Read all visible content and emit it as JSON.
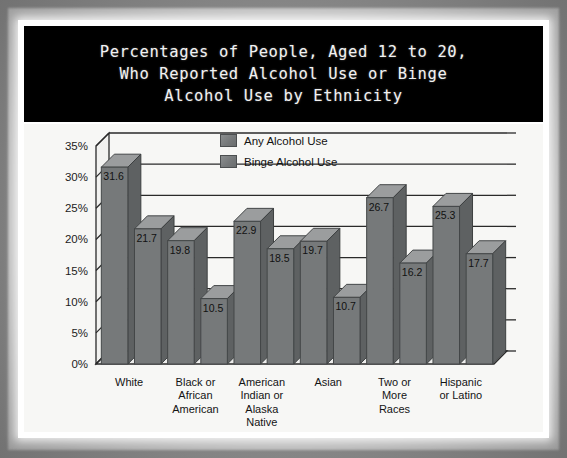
{
  "title": "Percentages of People, Aged 12 to 20,\nWho Reported Alcohol Use or Binge\nAlcohol Use by Ethnicity",
  "legend": {
    "items": [
      {
        "label": "Any Alcohol Use",
        "color": "#76797a"
      },
      {
        "label": "Binge Alcohol Use",
        "color": "#76797a"
      }
    ]
  },
  "colors": {
    "bar_face": "#76797a",
    "bar_top": "#9b9d9e",
    "bar_side": "#5e6162",
    "plot_background": "#f7f7f5",
    "gridline": "#2a2a2a",
    "banner_background": "#000000",
    "banner_text": "#f2f2f2",
    "frame": "#ffffff"
  },
  "chart_data": {
    "type": "bar",
    "title": "Percentages of People, Aged 12 to 20, Who Reported Alcohol Use or Binge Alcohol Use by Ethnicity",
    "xlabel": "",
    "ylabel": "",
    "ylim": [
      0,
      35
    ],
    "ytick_values": [
      0,
      5,
      10,
      15,
      20,
      25,
      30,
      35
    ],
    "ytick_labels": [
      "0%",
      "5%",
      "10%",
      "15%",
      "20%",
      "25%",
      "30%",
      "35%"
    ],
    "grid": true,
    "legend_position": "top-center",
    "categories": [
      "White",
      "Black or African American",
      "American Indian or Alaska Native",
      "Asian",
      "Two or More Races",
      "Hispanic or Latino"
    ],
    "category_lines": [
      [
        "White"
      ],
      [
        "Black or",
        "African",
        "American"
      ],
      [
        "American",
        "Indian or",
        "Alaska",
        "Native"
      ],
      [
        "Asian"
      ],
      [
        "Two or",
        "More",
        "Races"
      ],
      [
        "Hispanic",
        "or Latino"
      ]
    ],
    "series": [
      {
        "name": "Any Alcohol Use",
        "values": [
          31.6,
          19.8,
          22.9,
          19.7,
          26.7,
          25.3
        ]
      },
      {
        "name": "Binge Alcohol Use",
        "values": [
          21.7,
          10.5,
          18.5,
          10.7,
          16.2,
          17.7
        ]
      }
    ],
    "bar_order": [
      {
        "category": "White",
        "series": "Any Alcohol Use",
        "value": 31.6
      },
      {
        "category": "White",
        "series": "Binge Alcohol Use",
        "value": 21.7
      },
      {
        "category": "Black or African American",
        "series": "Any Alcohol Use",
        "value": 19.8
      },
      {
        "category": "Black or African American",
        "series": "Binge Alcohol Use",
        "value": 10.5
      },
      {
        "category": "American Indian or Alaska Native",
        "series": "Any Alcohol Use",
        "value": 22.9
      },
      {
        "category": "American Indian or Alaska Native",
        "series": "Binge Alcohol Use",
        "value": 18.5
      },
      {
        "category": "Asian",
        "series": "Any Alcohol Use",
        "value": 19.7
      },
      {
        "category": "Asian",
        "series": "Binge Alcohol Use",
        "value": 10.7
      },
      {
        "category": "Two or More Races",
        "series": "Any Alcohol Use",
        "value": 26.7
      },
      {
        "category": "Two or More Races",
        "series": "Binge Alcohol Use",
        "value": 16.2
      },
      {
        "category": "Hispanic or Latino",
        "series": "Any Alcohol Use",
        "value": 25.3
      },
      {
        "category": "Hispanic or Latino",
        "series": "Binge Alcohol Use",
        "value": 17.7
      }
    ]
  }
}
